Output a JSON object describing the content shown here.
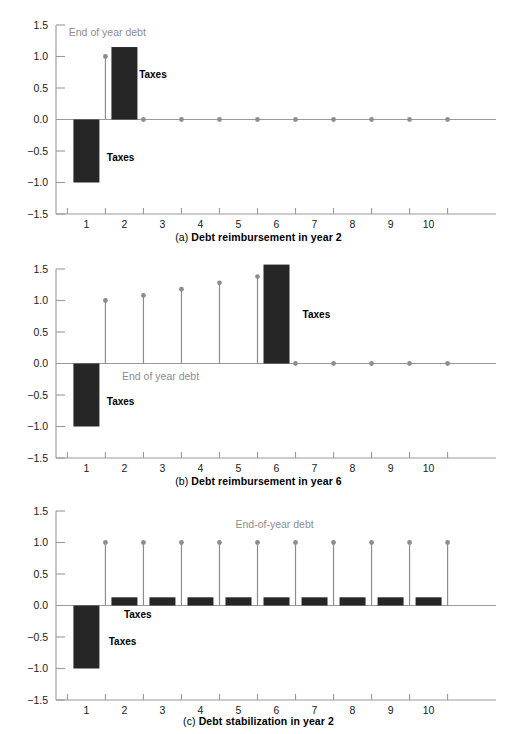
{
  "figure": {
    "colors": {
      "bar": "#262626",
      "stem": "#8d8d8d",
      "axis": "#999999",
      "tick_text": "#1a1a1a",
      "annotation_gray": "#8d8d8d",
      "annotation_black": "#000000",
      "background": "#ffffff"
    }
  },
  "panels": [
    {
      "id": "panel-a",
      "caption_index": "(a)",
      "caption_text": "Debt reimbursement in year 2",
      "annotations": [
        {
          "name": "end-of-year-debt-label",
          "text": "End of year debt",
          "color": "gray",
          "x": 1.55,
          "y": 1.33,
          "anchor": "middle"
        },
        {
          "name": "taxes-label-positive",
          "text": "Taxes",
          "color": "black",
          "x": 2.75,
          "y": 0.66,
          "anchor": "middle"
        },
        {
          "name": "taxes-label-negative",
          "text": "Taxes",
          "color": "black",
          "x": 1.9,
          "y": -0.66,
          "anchor": "middle"
        }
      ],
      "chart_data": {
        "type": "bar",
        "title": "(a) Debt reimbursement in year 2",
        "xlabel": "",
        "ylabel": "",
        "xlim": [
          0.2,
          11.3
        ],
        "ylim": [
          -1.5,
          1.5
        ],
        "grid": false,
        "legend": "annotations",
        "categories": [
          "1",
          "2",
          "3",
          "4",
          "5",
          "6",
          "7",
          "8",
          "9",
          "10"
        ],
        "series": [
          {
            "name": "Taxes",
            "type": "bar",
            "x": [
              1,
              2,
              3,
              4,
              5,
              6,
              7,
              8,
              9,
              10
            ],
            "values": [
              -1.0,
              1.15,
              0,
              0,
              0,
              0,
              0,
              0,
              0,
              0
            ]
          },
          {
            "name": "End of year debt",
            "type": "stem",
            "x": [
              1.5,
              2.5,
              3.5,
              4.5,
              5.5,
              6.5,
              7.5,
              8.5,
              9.5,
              10.5
            ],
            "values": [
              1.0,
              0,
              0,
              0,
              0,
              0,
              0,
              0,
              0,
              0
            ]
          }
        ],
        "ytick_labels": [
          "1.5",
          "1.0",
          "0.5",
          "0.0",
          "-0.5",
          "-1.0",
          "-1.5"
        ],
        "ytick_values": [
          1.5,
          1.0,
          0.5,
          0.0,
          -0.5,
          -1.0,
          -1.5
        ]
      }
    },
    {
      "id": "panel-b",
      "caption_index": "(b)",
      "caption_text": "Debt reimbursement in year 6",
      "annotations": [
        {
          "name": "end-of-year-debt-label",
          "text": "End of year debt",
          "color": "gray",
          "x": 2.95,
          "y": -0.26,
          "anchor": "middle"
        },
        {
          "name": "taxes-label-positive",
          "text": "Taxes",
          "color": "black",
          "x": 7.05,
          "y": 0.73,
          "anchor": "middle"
        },
        {
          "name": "taxes-label-negative",
          "text": "Taxes",
          "color": "black",
          "x": 1.9,
          "y": -0.66,
          "anchor": "middle"
        }
      ],
      "chart_data": {
        "type": "bar",
        "title": "(b) Debt reimbursement in year 6",
        "xlabel": "",
        "ylabel": "",
        "xlim": [
          0.2,
          11.3
        ],
        "ylim": [
          -1.5,
          1.5
        ],
        "grid": false,
        "legend": "annotations",
        "categories": [
          "1",
          "2",
          "3",
          "4",
          "5",
          "6",
          "7",
          "8",
          "9",
          "10"
        ],
        "series": [
          {
            "name": "Taxes",
            "type": "bar",
            "x": [
              1,
              2,
              3,
              4,
              5,
              6,
              7,
              8,
              9,
              10
            ],
            "values": [
              -1.0,
              0,
              0,
              0,
              0,
              1.57,
              0,
              0,
              0,
              0
            ]
          },
          {
            "name": "End of year debt",
            "type": "stem",
            "x": [
              1.5,
              2.5,
              3.5,
              4.5,
              5.5,
              6.5,
              7.5,
              8.5,
              9.5,
              10.5
            ],
            "values": [
              1.0,
              1.08,
              1.18,
              1.28,
              1.38,
              0,
              0,
              0,
              0,
              0
            ]
          }
        ],
        "ytick_labels": [
          "1.5",
          "1.0",
          "0.5",
          "0.0",
          "-0.5",
          "-1.0",
          "-1.5"
        ],
        "ytick_values": [
          1.5,
          1.0,
          0.5,
          0.0,
          -0.5,
          -1.0,
          -1.5
        ]
      }
    },
    {
      "id": "panel-c",
      "caption_index": "(c)",
      "caption_text": "Debt stabilization in year 2",
      "annotations": [
        {
          "name": "end-of-year-debt-label",
          "text": "End-of-year debt",
          "color": "gray",
          "x": 5.95,
          "y": 1.23,
          "anchor": "middle"
        },
        {
          "name": "taxes-label-upper",
          "text": "Taxes",
          "color": "black",
          "x": 2.35,
          "y": -0.2,
          "anchor": "middle"
        },
        {
          "name": "taxes-label-negative",
          "text": "Taxes",
          "color": "black",
          "x": 1.95,
          "y": -0.62,
          "anchor": "middle"
        }
      ],
      "chart_data": {
        "type": "bar",
        "title": "(c) Debt stabilization in year 2",
        "xlabel": "",
        "ylabel": "",
        "xlim": [
          0.2,
          11.3
        ],
        "ylim": [
          -1.5,
          1.5
        ],
        "grid": false,
        "legend": "annotations",
        "categories": [
          "1",
          "2",
          "3",
          "4",
          "5",
          "6",
          "7",
          "8",
          "9",
          "10"
        ],
        "series": [
          {
            "name": "Taxes",
            "type": "bar",
            "x": [
              1,
              2,
              3,
              4,
              5,
              6,
              7,
              8,
              9,
              10
            ],
            "values": [
              -1.0,
              0.13,
              0.13,
              0.13,
              0.13,
              0.13,
              0.13,
              0.13,
              0.13,
              0.13
            ]
          },
          {
            "name": "End-of-year debt",
            "type": "stem",
            "x": [
              1.5,
              2.5,
              3.5,
              4.5,
              5.5,
              6.5,
              7.5,
              8.5,
              9.5,
              10.5
            ],
            "values": [
              1.0,
              1.0,
              1.0,
              1.0,
              1.0,
              1.0,
              1.0,
              1.0,
              1.0,
              1.0
            ]
          }
        ],
        "ytick_labels": [
          "1.5",
          "1.0",
          "0.5",
          "0.0",
          "-0.5",
          "-1.0",
          "-1.5"
        ],
        "ytick_values": [
          1.5,
          1.0,
          0.5,
          0.0,
          -0.5,
          -1.0,
          -1.5
        ]
      }
    }
  ]
}
